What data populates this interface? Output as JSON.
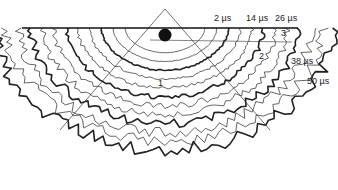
{
  "figure": {
    "type": "isochron contour diagram",
    "surface_line": "horizontal surface line",
    "source": "black dot source below surface apex",
    "time_labels": [
      {
        "text": "2 µs",
        "x": 214,
        "y": 14
      },
      {
        "text": "14 µs",
        "x": 246,
        "y": 14
      },
      {
        "text": "26 µs",
        "x": 275,
        "y": 14
      },
      {
        "text": "38 µs",
        "x": 291,
        "y": 57
      },
      {
        "text": "50 µs",
        "x": 307,
        "y": 77
      }
    ],
    "region_labels": [
      {
        "text": "1",
        "x": 158,
        "y": 79
      },
      {
        "text": "2",
        "x": 259,
        "y": 52
      },
      {
        "text": "3",
        "x": 281,
        "y": 29
      }
    ],
    "contours": {
      "count": 12,
      "bold_every": 3,
      "stroke_color": "#222222",
      "times_us": [
        2,
        14,
        26,
        38,
        50
      ]
    }
  }
}
